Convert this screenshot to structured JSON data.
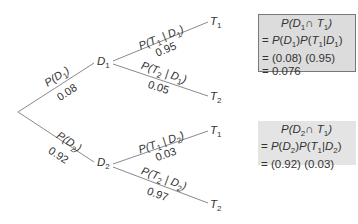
{
  "tree": {
    "nodes": {
      "d1": "D",
      "d1_sub": "1",
      "d2": "D",
      "d2_sub": "2",
      "t1_top": "T",
      "t1_top_sub": "1",
      "t2_top": "T",
      "t2_top_sub": "2",
      "t1_bot": "T",
      "t1_bot_sub": "1",
      "t2_bot": "T",
      "t2_bot_sub": "2"
    },
    "branches": [
      {
        "label": "P(D1)",
        "value": "0.08"
      },
      {
        "label": "P(D2)",
        "value": "0.92"
      },
      {
        "label": "P(T1 | D1)",
        "value": "0.95"
      },
      {
        "label": "P(T2 | D1)",
        "value": "0.05"
      },
      {
        "label": "P(T1 | D2)",
        "value": "0.03"
      },
      {
        "label": "P(T2 | D2)",
        "value": "0.97"
      }
    ]
  },
  "boxes": [
    {
      "lines": [
        "P(D1 ∩ T1)",
        "= P(D1)P(T1|D1)",
        "= (0.08) (0.95)",
        "= 0.076"
      ]
    },
    {
      "lines": [
        "P(D2 ∩ T1)",
        "= P(D2)P(T1|D2)",
        "= (0.92) (0.03)"
      ]
    }
  ],
  "colors": {
    "line": "#8a8a8a",
    "box1_fill": "#dcdcdc",
    "box2_fill": "#e4e4e4",
    "text": "#333333"
  }
}
